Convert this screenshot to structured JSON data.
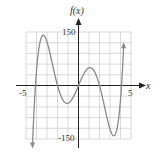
{
  "chart_data": {
    "type": "line",
    "title": "",
    "xlabel": "x",
    "ylabel": "f(x)",
    "xlim": [
      -5,
      5
    ],
    "ylim": [
      -150,
      150
    ],
    "grid": true,
    "x_ticks_labeled": [
      "-5",
      "5"
    ],
    "y_ticks_labeled": [
      "150",
      "-150"
    ],
    "series": [
      {
        "name": "f(x)",
        "points": [
          [
            -4.4,
            -165
          ],
          [
            -4.1,
            0
          ],
          [
            -3.6,
            85
          ],
          [
            -3.2,
            110
          ],
          [
            -2.8,
            85
          ],
          [
            -2.0,
            0
          ],
          [
            -1.5,
            -40
          ],
          [
            -1.1,
            -50
          ],
          [
            -0.6,
            -35
          ],
          [
            0,
            0
          ],
          [
            0.6,
            35
          ],
          [
            1.1,
            50
          ],
          [
            1.5,
            40
          ],
          [
            2.0,
            0
          ],
          [
            2.8,
            -85
          ],
          [
            3.2,
            -110
          ],
          [
            3.6,
            -85
          ],
          [
            4.1,
            0
          ],
          [
            4.3,
            170
          ]
        ],
        "color": "#888888"
      }
    ]
  },
  "labels": {
    "y_axis": "f(x)",
    "x_axis": "x",
    "y_max": "150",
    "y_min": "-150",
    "x_min": "-5",
    "x_max": "5"
  },
  "colors": {
    "grid": "#c8c8c8",
    "axis": "#222222",
    "curve": "#8a8a8a"
  }
}
